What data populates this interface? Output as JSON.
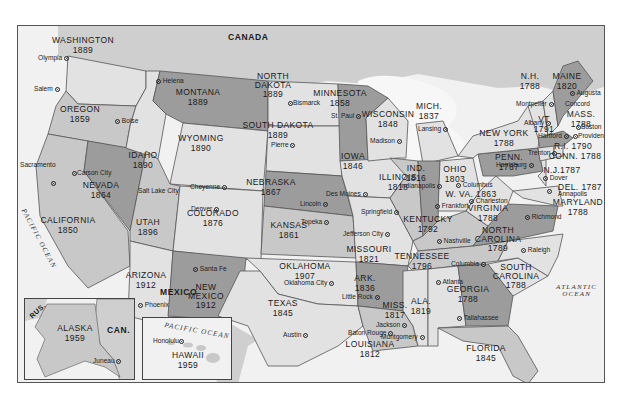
{
  "map": {
    "title": "United States — Dates of Statehood",
    "colors": {
      "frame_border": "#555555",
      "water": "#f1f1f1",
      "foreign_land": "#cfcfcf",
      "shade_light": "#e2e2e2",
      "shade_mid": "#c8c8c8",
      "shade_dark": "#9c9c9c",
      "text": "#1a1a1a"
    },
    "countries": {
      "canada": "CANADA",
      "mexico": "MEXICO",
      "russia_inset": "RUS.",
      "canada_inset": "CAN."
    },
    "oceans": {
      "pacific": "PACIFIC OCEAN",
      "atlantic_line1": "ATLANTIC",
      "atlantic_line2": "OCEAN",
      "pacific_hawaii": "PACIFIC OCEAN"
    },
    "states": [
      {
        "id": "wa",
        "name": "WASHINGTON",
        "year": "1889",
        "capital": "Olympia"
      },
      {
        "id": "or",
        "name": "OREGON",
        "year": "1859",
        "capital": "Salem"
      },
      {
        "id": "ca",
        "name": "CALIFORNIA",
        "year": "1850",
        "capital": "Sacramento"
      },
      {
        "id": "nv",
        "name": "NEVADA",
        "year": "1864",
        "capital": "Carson City"
      },
      {
        "id": "id",
        "name": "IDAHO",
        "year": "1890",
        "capital": "Boise"
      },
      {
        "id": "mt",
        "name": "MONTANA",
        "year": "1889",
        "capital": "Helena"
      },
      {
        "id": "wy",
        "name": "WYOMING",
        "year": "1890",
        "capital": "Cheyenne"
      },
      {
        "id": "ut",
        "name": "UTAH",
        "year": "1896",
        "capital": "Salt Lake City"
      },
      {
        "id": "co",
        "name": "COLORADO",
        "year": "1876",
        "capital": "Denver"
      },
      {
        "id": "az",
        "name": "ARIZONA",
        "year": "1912",
        "capital": "Phoenix"
      },
      {
        "id": "nm",
        "name": "NEW MEXICO",
        "year": "1912",
        "capital": "Santa Fe"
      },
      {
        "id": "nd",
        "name": "NORTH DAKOTA",
        "year": "1889",
        "capital": "Bismarck"
      },
      {
        "id": "sd",
        "name": "SOUTH DAKOTA",
        "year": "1889",
        "capital": "Pierre"
      },
      {
        "id": "ne",
        "name": "NEBRASKA",
        "year": "1867",
        "capital": "Lincoln"
      },
      {
        "id": "ks",
        "name": "KANSAS",
        "year": "1861",
        "capital": "Topeka"
      },
      {
        "id": "ok",
        "name": "OKLAHOMA",
        "year": "1907",
        "capital": "Oklahoma City"
      },
      {
        "id": "tx",
        "name": "TEXAS",
        "year": "1845",
        "capital": "Austin"
      },
      {
        "id": "mn",
        "name": "MINNESOTA",
        "year": "1858",
        "capital": "St. Paul"
      },
      {
        "id": "ia",
        "name": "IOWA",
        "year": "1846",
        "capital": "Des Moines"
      },
      {
        "id": "mo",
        "name": "MISSOURI",
        "year": "1821",
        "capital": "Jefferson City"
      },
      {
        "id": "ar",
        "name": "ARK.",
        "year": "1836",
        "capital": "Little Rock"
      },
      {
        "id": "la",
        "name": "LOUISIANA",
        "year": "1812",
        "capital": "Baton Rouge"
      },
      {
        "id": "wi",
        "name": "WISCONSIN",
        "year": "1848",
        "capital": "Madison"
      },
      {
        "id": "il",
        "name": "ILLINOIS",
        "year": "1818",
        "capital": "Springfield"
      },
      {
        "id": "mi",
        "name": "MICH.",
        "year": "1837",
        "capital": "Lansing"
      },
      {
        "id": "in",
        "name": "IND.",
        "year": "1816",
        "capital": "Indianapolis"
      },
      {
        "id": "oh",
        "name": "OHIO",
        "year": "1803",
        "capital": "Columbus"
      },
      {
        "id": "ky",
        "name": "KENTUCKY",
        "year": "1792",
        "capital": "Frankfort"
      },
      {
        "id": "tn",
        "name": "TENNESSEE",
        "year": "1796",
        "capital": "Nashville"
      },
      {
        "id": "ms",
        "name": "MISS.",
        "year": "1817",
        "capital": "Jackson"
      },
      {
        "id": "al",
        "name": "ALA.",
        "year": "1819",
        "capital": "Montgomery"
      },
      {
        "id": "ga",
        "name": "GEORGIA",
        "year": "1788",
        "capital": "Atlanta"
      },
      {
        "id": "fl",
        "name": "FLORIDA",
        "year": "1845",
        "capital": "Tallahassee"
      },
      {
        "id": "sc",
        "name": "SOUTH CAROLINA",
        "year": "1788",
        "capital": "Columbia"
      },
      {
        "id": "nc",
        "name": "NORTH CAROLINA",
        "year": "1789",
        "capital": "Raleigh"
      },
      {
        "id": "va",
        "name": "VIRGINIA",
        "year": "1788",
        "capital": "Richmond"
      },
      {
        "id": "wv",
        "name": "W. VA.",
        "year": "1863",
        "capital": "Charleston"
      },
      {
        "id": "md",
        "name": "MARYLAND",
        "year": "1788",
        "capital": "Annapolis"
      },
      {
        "id": "de",
        "name": "DEL.",
        "year": "1787",
        "capital": "Dover"
      },
      {
        "id": "pa",
        "name": "PENN.",
        "year": "1787",
        "capital": "Harrisburg"
      },
      {
        "id": "nj",
        "name": "N.J.",
        "year": "1787",
        "capital": "Trenton"
      },
      {
        "id": "ny",
        "name": "NEW YORK",
        "year": "1788",
        "capital": "Albany"
      },
      {
        "id": "ct",
        "name": "CONN.",
        "year": "1788",
        "capital": "Hartford"
      },
      {
        "id": "ri",
        "name": "R.I.",
        "year": "1790",
        "capital": "Providence"
      },
      {
        "id": "ma",
        "name": "MASS.",
        "year": "1788",
        "capital": "Boston"
      },
      {
        "id": "vt",
        "name": "VT",
        "year": "1791",
        "capital": "Montpelier"
      },
      {
        "id": "nh",
        "name": "N.H.",
        "year": "1788",
        "capital": "Concord"
      },
      {
        "id": "me",
        "name": "MAINE",
        "year": "1820",
        "capital": "Augusta"
      },
      {
        "id": "ak",
        "name": "ALASKA",
        "year": "1959",
        "capital": "Juneau"
      },
      {
        "id": "hi",
        "name": "HAWAII",
        "year": "1959",
        "capital": "Honolulu"
      }
    ]
  }
}
